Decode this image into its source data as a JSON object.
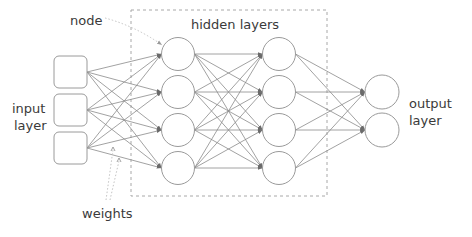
{
  "labels": {
    "node": "node",
    "hidden_layers": "hidden layers",
    "input_line1": "input",
    "input_line2": "layer",
    "output_line1": "output",
    "output_line2": "layer",
    "weights": "weights"
  },
  "network": {
    "input_nodes": 3,
    "hidden_layers": [
      4,
      4
    ],
    "output_nodes": 2,
    "fully_connected": true
  },
  "colors": {
    "line": "#8a8a8a",
    "node_stroke": "#9a9a9a",
    "text": "#3a3a3a",
    "dashed_box": "#a8a8a8"
  }
}
